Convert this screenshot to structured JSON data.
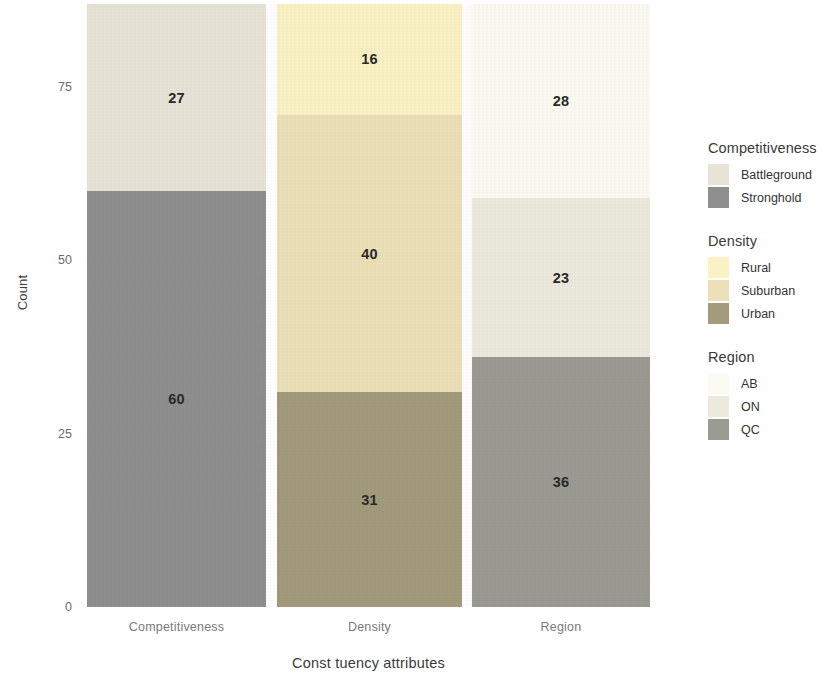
{
  "chart_data": {
    "type": "bar",
    "stacked": true,
    "title": "",
    "xlabel": "Const tuency attributes",
    "ylabel": "Count",
    "ylim": [
      0,
      87
    ],
    "yticks": [
      0,
      25,
      50,
      75
    ],
    "ytick_labels": [
      "0",
      "25",
      "50",
      "75"
    ],
    "grid": false,
    "legend_position": "right",
    "categories": [
      "Competitiveness",
      "Density",
      "Region"
    ],
    "bars": [
      {
        "category": "Competitiveness",
        "total": 87,
        "segments": [
          {
            "label": "Stronghold",
            "value": 60,
            "display": "60",
            "color": "#8f8f8f"
          },
          {
            "label": "Battleground",
            "value": 27,
            "display": "27",
            "color": "#e7e3d6"
          }
        ]
      },
      {
        "category": "Density",
        "total": 87,
        "segments": [
          {
            "label": "Urban",
            "value": 31,
            "display": "31",
            "color": "#a39b7c"
          },
          {
            "label": "Suburban",
            "value": 40,
            "display": "40",
            "color": "#ebe0b7"
          },
          {
            "label": "Rural",
            "value": 16,
            "display": "16",
            "color": "#faf2c4"
          }
        ]
      },
      {
        "category": "Region",
        "total": 87,
        "segments": [
          {
            "label": "QC",
            "value": 36,
            "display": "36",
            "color": "#9b9b94"
          },
          {
            "label": "ON",
            "value": 23,
            "display": "23",
            "color": "#eceadd"
          },
          {
            "label": "AB",
            "value": 28,
            "display": "28",
            "color": "#fbfaf3"
          }
        ]
      }
    ],
    "legend": [
      {
        "title": "Competitiveness",
        "entries": [
          {
            "label": "Battleground",
            "color": "#e7e3d6"
          },
          {
            "label": "Stronghold",
            "color": "#8f8f8f"
          }
        ]
      },
      {
        "title": "Density",
        "entries": [
          {
            "label": "Rural",
            "color": "#faf2c4"
          },
          {
            "label": "Suburban",
            "color": "#ebe0b7"
          },
          {
            "label": "Urban",
            "color": "#a39b7c"
          }
        ]
      },
      {
        "title": "Region",
        "entries": [
          {
            "label": "AB",
            "color": "#fbfaf3"
          },
          {
            "label": "ON",
            "color": "#eceadd"
          },
          {
            "label": "QC",
            "color": "#9b9b94"
          }
        ]
      }
    ]
  }
}
